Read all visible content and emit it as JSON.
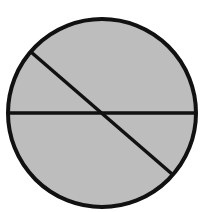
{
  "diagram": {
    "type": "circle-divided-by-chords",
    "width": 217,
    "height": 212,
    "background_color": "#ffffff",
    "circle": {
      "cx": 102,
      "cy": 113,
      "r": 94,
      "fill_color": "#bdbdbd",
      "stroke_color": "#111111",
      "stroke_width": 4
    },
    "lines": [
      {
        "name": "horizontal-diameter",
        "x1": 8,
        "y1": 113,
        "x2": 196,
        "y2": 113
      },
      {
        "name": "diagonal-chord",
        "x1": 31,
        "y1": 52,
        "x2": 172,
        "y2": 174
      }
    ],
    "line_color": "#111111",
    "line_width": 3.5
  }
}
